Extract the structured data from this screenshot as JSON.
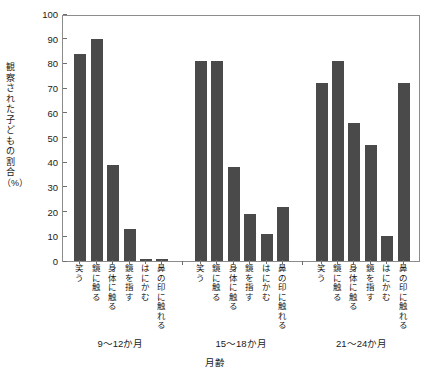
{
  "chart_data": {
    "type": "bar",
    "title": "",
    "xlabel": "月齢",
    "ylabel": "観察された子どもの割合（%）",
    "ylim": [
      0,
      100
    ],
    "ytick_labels": [
      "0",
      "10",
      "20",
      "30",
      "40",
      "50",
      "60",
      "70",
      "80",
      "90",
      "100"
    ],
    "ytick_values": [
      0,
      10,
      20,
      30,
      40,
      50,
      60,
      70,
      80,
      90,
      100
    ],
    "grid": false,
    "legend": "none",
    "bar_color": "#4a4a4a",
    "categories": [
      "笑う",
      "鏡に触る",
      "身体に触る",
      "鏡を指す",
      "はにかむ",
      "鼻の印に触れる"
    ],
    "groups": [
      "9〜12か月",
      "15〜18か月",
      "21〜24か月"
    ],
    "series": [
      {
        "name": "9〜12か月",
        "values": [
          84,
          90,
          39,
          13,
          1,
          1
        ]
      },
      {
        "name": "15〜18か月",
        "values": [
          81,
          81,
          38,
          19,
          11,
          22
        ]
      },
      {
        "name": "21〜24か月",
        "values": [
          72,
          81,
          56,
          47,
          10,
          72
        ]
      }
    ]
  }
}
